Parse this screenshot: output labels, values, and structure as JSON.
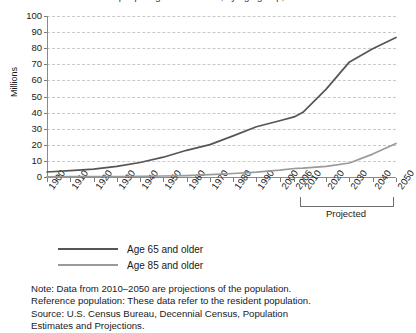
{
  "chart_data": {
    "type": "line",
    "title": "Number of people age 65 and older, by age group, 1900–2050",
    "xlabel": "",
    "ylabel": "Millions",
    "ylim": [
      0,
      100
    ],
    "ytick_values": [
      0,
      10,
      20,
      30,
      40,
      50,
      60,
      70,
      80,
      90,
      100
    ],
    "grid": true,
    "legend_position": "below-left",
    "categories": [
      1900,
      1910,
      1920,
      1930,
      1940,
      1950,
      1960,
      1970,
      1980,
      1990,
      2000,
      2006,
      2010,
      2020,
      2030,
      2040,
      2050
    ],
    "tick_labels": [
      "1900",
      "1910",
      "1920",
      "1930",
      "1940",
      "1950",
      "1960",
      "1970",
      "1980",
      "1990",
      "2000",
      "2006",
      "2010",
      "2020",
      "2030",
      "2040",
      "2050"
    ],
    "series": [
      {
        "name": "Age 65 and older",
        "color": "#555555",
        "values": [
          3.1,
          3.9,
          4.9,
          6.6,
          9.0,
          12.3,
          16.6,
          20.1,
          25.5,
          31.2,
          35.0,
          37.3,
          40.2,
          54.6,
          71.5,
          79.7,
          86.7
        ]
      },
      {
        "name": "Age 85 and older",
        "color": "#9a9a9a",
        "values": [
          0.1,
          0.2,
          0.2,
          0.3,
          0.4,
          0.6,
          0.9,
          1.4,
          2.2,
          3.0,
          4.2,
          5.3,
          5.5,
          6.6,
          8.7,
          14.2,
          20.9
        ]
      }
    ],
    "annotations": [
      {
        "name": "projected-bracket",
        "label": "Projected",
        "from": "2010",
        "to": "2050"
      }
    ]
  },
  "legend": {
    "items": [
      {
        "label": "Age 65 and older",
        "color": "#555555"
      },
      {
        "label": "Age 85 and older",
        "color": "#9a9a9a"
      }
    ]
  },
  "notes": {
    "lines": [
      "Note: Data from 2010–2050 are projections of the population.",
      "Reference population: These data refer to the resident population.",
      "Source: U.S. Census Bureau, Decennial Census, Population",
      "Estimates and Projections."
    ]
  }
}
